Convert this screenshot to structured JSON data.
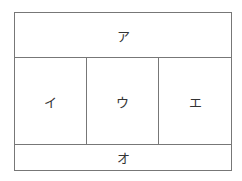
{
  "diagram": {
    "top": {
      "label": "ア"
    },
    "middle": [
      {
        "label": "イ"
      },
      {
        "label": "ウ"
      },
      {
        "label": "エ"
      }
    ],
    "bottom": {
      "label": "オ"
    }
  }
}
